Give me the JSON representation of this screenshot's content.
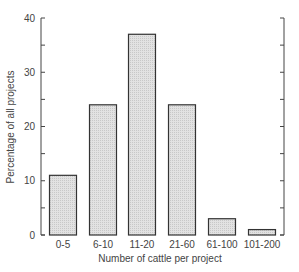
{
  "chart_data": {
    "type": "bar",
    "title": "",
    "xlabel": "Number of cattle per project",
    "ylabel": "Percentage of all projects",
    "categories": [
      "0-5",
      "6-10",
      "11-20",
      "21-60",
      "61-100",
      "101-200"
    ],
    "values": [
      11,
      24,
      37,
      24,
      3,
      1
    ],
    "ylim": [
      0,
      40
    ],
    "yticks": [
      0,
      10,
      20,
      30,
      40
    ],
    "minor_yticks": [
      5,
      15,
      25,
      35
    ],
    "grid": false,
    "legend": null,
    "right_axis_ticks_only": true
  },
  "colors": {
    "bar_fill": "#e2e2e2",
    "bar_stroke": "#333333",
    "axis": "#444444"
  }
}
